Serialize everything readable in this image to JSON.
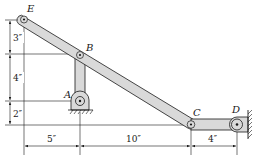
{
  "diagram": {
    "type": "mechanism-linkage",
    "points": {
      "E": {
        "label": "E"
      },
      "B": {
        "label": "B"
      },
      "A": {
        "label": "A"
      },
      "C": {
        "label": "C"
      },
      "D": {
        "label": "D"
      }
    },
    "vertical_dimensions": [
      {
        "label": "3″",
        "from": "E",
        "to": "B"
      },
      {
        "label": "4″",
        "from": "B",
        "to": "A"
      },
      {
        "label": "2″",
        "from": "A",
        "to": "C"
      }
    ],
    "horizontal_dimensions": [
      {
        "label": "5″",
        "from": "E",
        "to": "A"
      },
      {
        "label": "10″",
        "from": "A",
        "to": "C"
      },
      {
        "label": "4″",
        "from": "C",
        "to": "D"
      }
    ],
    "members": [
      {
        "name": "link-EC",
        "from": "E",
        "to": "C"
      },
      {
        "name": "link-AB",
        "from": "A",
        "to": "B"
      },
      {
        "name": "link-CD",
        "from": "C",
        "to": "D"
      }
    ],
    "supports": [
      {
        "name": "ground-pin-A",
        "at": "A",
        "kind": "pinned-ground"
      },
      {
        "name": "wall-pin-D",
        "at": "D",
        "kind": "pinned-wall"
      }
    ],
    "colors": {
      "link_fill": "#d9d9d9",
      "line": "#1a1a1a",
      "background": "#ffffff"
    }
  }
}
